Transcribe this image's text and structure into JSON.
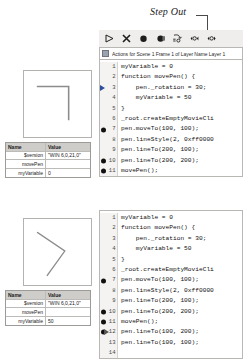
{
  "annotation": {
    "label": "Step Out"
  },
  "debugger": {
    "toolbar": {
      "buttons": [
        {
          "name": "continue-button",
          "icon": "play-icon",
          "title": "Continue"
        },
        {
          "name": "stop-debugging-button",
          "icon": "stop-x-icon",
          "title": "Stop Debugging"
        },
        {
          "name": "toggle-breakpoint-button",
          "icon": "breakpoint-circle-icon",
          "title": "Toggle Breakpoint"
        },
        {
          "name": "remove-breakpoints-button",
          "icon": "remove-breakpoints-icon",
          "title": "Remove All Breakpoints"
        },
        {
          "name": "step-in-button",
          "icon": "step-in-icon",
          "title": "Step In"
        },
        {
          "name": "step-over-button",
          "icon": "step-over-icon",
          "title": "Step Over"
        },
        {
          "name": "step-out-button",
          "icon": "step-out-icon",
          "title": "Step Out"
        }
      ]
    },
    "script_title": "Actions for Scene 1 Frame 1 of Layer Name Layer 1"
  },
  "code_panels": [
    {
      "id": "code-panel-before",
      "lines": [
        {
          "num": "1",
          "text": "myVariable = 0",
          "marker": "none",
          "indent": 0
        },
        {
          "num": "2",
          "text": "function movePen() {",
          "marker": "none",
          "indent": 0
        },
        {
          "num": "3",
          "text": "    pen._rotation = 30;",
          "marker": "arrow",
          "indent": 0
        },
        {
          "num": "4",
          "text": "    myVariable = 50",
          "marker": "none",
          "indent": 0
        },
        {
          "num": "5",
          "text": "}",
          "marker": "none",
          "indent": 0
        },
        {
          "num": "6",
          "text": "_root.createEmptyMovieCli",
          "marker": "none",
          "indent": 0
        },
        {
          "num": "7",
          "text": "pen.moveTo(100, 100);",
          "marker": "dot",
          "indent": 0
        },
        {
          "num": "8",
          "text": "pen.lineStyle(2, 0xff0000",
          "marker": "none",
          "indent": 0
        },
        {
          "num": "9",
          "text": "pen.lineTo(200, 100);",
          "marker": "none",
          "indent": 0
        },
        {
          "num": "10",
          "text": "pen.lineTo(200, 200);",
          "marker": "dot",
          "indent": 0
        },
        {
          "num": "11",
          "text": "movePen();",
          "marker": "dot",
          "indent": 0
        },
        {
          "num": "12",
          "text": "pen.lineTo(100, 200);",
          "marker": "none",
          "indent": 0
        },
        {
          "num": "13",
          "text": "pen.lineTo(100, 100);",
          "marker": "none",
          "indent": 0
        },
        {
          "num": "14",
          "text": "",
          "marker": "none",
          "indent": 0
        }
      ]
    },
    {
      "id": "code-panel-after",
      "lines": [
        {
          "num": "1",
          "text": "myVariable = 0",
          "marker": "none",
          "indent": 0
        },
        {
          "num": "2",
          "text": "function movePen() {",
          "marker": "none",
          "indent": 0
        },
        {
          "num": "3",
          "text": "    pen._rotation = 30;",
          "marker": "none",
          "indent": 0
        },
        {
          "num": "4",
          "text": "    myVariable = 50",
          "marker": "none",
          "indent": 0
        },
        {
          "num": "5",
          "text": "}",
          "marker": "none",
          "indent": 0
        },
        {
          "num": "6",
          "text": "_root.createEmptyMovieCli",
          "marker": "none",
          "indent": 0
        },
        {
          "num": "7",
          "text": "pen.moveTo(100, 100);",
          "marker": "dot",
          "indent": 0
        },
        {
          "num": "8",
          "text": "pen.lineStyle(2, 0xff0000",
          "marker": "none",
          "indent": 0
        },
        {
          "num": "9",
          "text": "pen.lineTo(200, 100);",
          "marker": "none",
          "indent": 0
        },
        {
          "num": "10",
          "text": "pen.lineTo(200, 200);",
          "marker": "dot",
          "indent": 0
        },
        {
          "num": "11",
          "text": "movePen();",
          "marker": "dot",
          "indent": 0
        },
        {
          "num": "12",
          "text": "pen.lineTo(100, 200);",
          "marker": "dotarrow",
          "indent": 0
        },
        {
          "num": "13",
          "text": "pen.lineTo(100, 100);",
          "marker": "none",
          "indent": 0
        },
        {
          "num": "14",
          "text": "",
          "marker": "none",
          "indent": 0
        }
      ]
    }
  ],
  "stages": [
    {
      "id": "stage-before",
      "drawing": "corner-shape-unrotated"
    },
    {
      "id": "stage-after",
      "drawing": "corner-shape-rotated-30"
    }
  ],
  "variables_tables": [
    {
      "id": "variables-before",
      "headers": {
        "name": "Name",
        "value": "Value"
      },
      "rows": [
        {
          "name": "$version",
          "value": "\"WIN 6,0,21,0\"",
          "indent": true
        },
        {
          "name": "movePen",
          "value": "",
          "indent": true
        },
        {
          "name": "myVariable",
          "value": "0",
          "indent": true
        }
      ]
    },
    {
      "id": "variables-after",
      "headers": {
        "name": "Name",
        "value": "Value"
      },
      "rows": [
        {
          "name": "$version",
          "value": "\"WIN 6,0,21,0\"",
          "indent": true
        },
        {
          "name": "movePen",
          "value": "",
          "indent": true
        },
        {
          "name": "myVariable",
          "value": "50",
          "indent": true
        }
      ]
    }
  ],
  "colors": {
    "panel_bg": "#f2f1ef",
    "border": "#b9b7b3",
    "header_bg": "#cfcdc9",
    "marker": "#111111",
    "arrow": "#2b4f9e"
  }
}
